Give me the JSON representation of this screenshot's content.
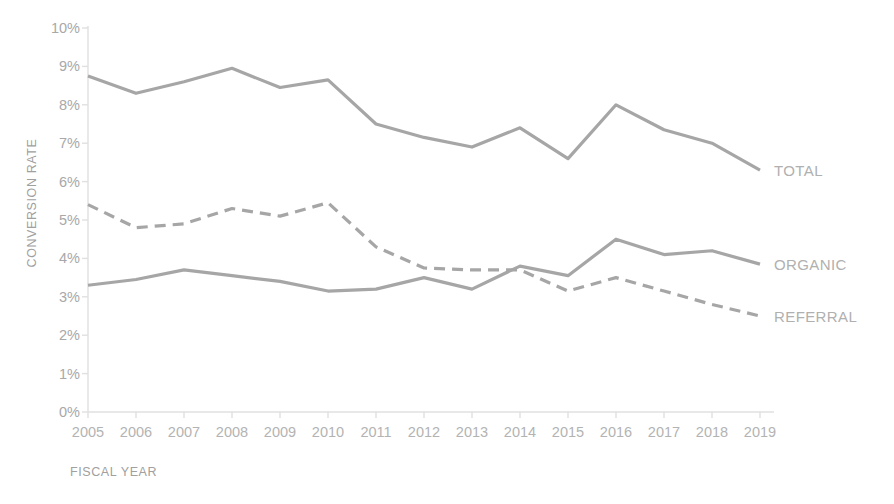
{
  "chart_data": {
    "type": "line",
    "title": "",
    "xlabel": "FISCAL YEAR",
    "ylabel": "CONVERSION RATE",
    "categories": [
      "2005",
      "2006",
      "2007",
      "2008",
      "2009",
      "2010",
      "2011",
      "2012",
      "2013",
      "2014",
      "2015",
      "2016",
      "2017",
      "2018",
      "2019"
    ],
    "x": [
      2005,
      2006,
      2007,
      2008,
      2009,
      2010,
      2011,
      2012,
      2013,
      2014,
      2015,
      2016,
      2017,
      2018,
      2019
    ],
    "ylim": [
      0,
      10
    ],
    "ytick_labels": [
      "0%",
      "1%",
      "2%",
      "3%",
      "4%",
      "5%",
      "6%",
      "7%",
      "8%",
      "9%",
      "10%"
    ],
    "ytick_values": [
      0,
      1,
      2,
      3,
      4,
      5,
      6,
      7,
      8,
      9,
      10
    ],
    "y_unit": "%",
    "grid": false,
    "legend_position": "right-end-labels",
    "series": [
      {
        "name": "TOTAL",
        "style": "solid",
        "color": "#a6a6a6",
        "values": [
          8.75,
          8.3,
          8.6,
          8.95,
          8.45,
          8.65,
          7.5,
          7.15,
          6.9,
          7.4,
          6.6,
          8.0,
          7.35,
          7.0,
          6.3
        ]
      },
      {
        "name": "ORGANIC",
        "style": "solid",
        "color": "#a6a6a6",
        "values": [
          3.3,
          3.45,
          3.7,
          3.55,
          3.4,
          3.15,
          3.2,
          3.5,
          3.2,
          3.8,
          3.55,
          4.5,
          4.1,
          4.2,
          3.85
        ]
      },
      {
        "name": "REFERRAL",
        "style": "dashed",
        "color": "#a6a6a6",
        "values": [
          5.4,
          4.8,
          4.9,
          5.3,
          5.1,
          5.45,
          4.3,
          3.75,
          3.7,
          3.7,
          3.15,
          3.5,
          3.15,
          2.8,
          2.5
        ]
      }
    ]
  },
  "axis": {
    "y_title": "CONVERSION RATE",
    "x_title": "FISCAL YEAR"
  },
  "colors": {
    "line": "#a6a6a6",
    "axis": "#e0e0e0",
    "tick_text": "#b3b3b3",
    "axis_title_text": "#a0a0a0",
    "series_label_text": "#b0b0b0",
    "background": "#ffffff"
  }
}
